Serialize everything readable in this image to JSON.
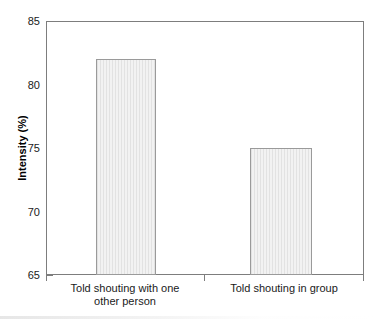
{
  "chart_data": {
    "type": "bar",
    "title": "",
    "xlabel": "",
    "ylabel": "Intensity (%)",
    "categories": [
      "Told shouting with one\nother person",
      "Told shouting in group"
    ],
    "values": [
      82,
      75
    ],
    "ylim": [
      65,
      85
    ],
    "yticks": [
      "65",
      "70",
      "75",
      "80",
      "85"
    ],
    "ytick_values": [
      65,
      70,
      75,
      80,
      85
    ],
    "grid": false,
    "legend": "none",
    "series": [
      {
        "name": "Intensity",
        "values": [
          82,
          75
        ]
      }
    ]
  },
  "style": {
    "bar_fill": "#e9e9e9",
    "bar_stroke": "#9a9a9a",
    "axis_color": "#7d7d7d",
    "text_color": "#1a1a1a",
    "background": "#ffffff"
  }
}
